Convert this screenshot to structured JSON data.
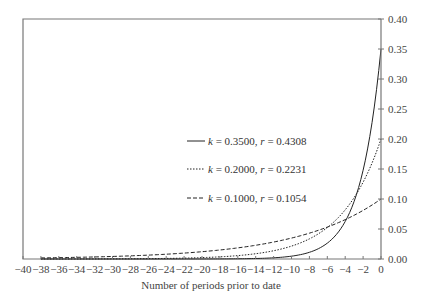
{
  "chart_data": {
    "type": "line",
    "title": "",
    "xlabel": "Number of periods prior to date",
    "ylabel": "",
    "xlim": [
      -40,
      0
    ],
    "ylim": [
      0,
      0.4
    ],
    "grid": false,
    "legend_position": "center-right inside plot",
    "x_ticks": [
      -40,
      -38,
      -36,
      -34,
      -32,
      -30,
      -28,
      -26,
      -24,
      -22,
      -20,
      -18,
      -16,
      -14,
      -12,
      -10,
      -8,
      -6,
      -4,
      -2,
      0
    ],
    "y_ticks": [
      "0.00",
      "0.05",
      "0.10",
      "0.15",
      "0.20",
      "0.25",
      "0.30",
      "0.35",
      "0.40"
    ],
    "x": [
      -38,
      -36,
      -34,
      -32,
      -30,
      -28,
      -26,
      -24,
      -22,
      -20,
      -18,
      -16,
      -14,
      -12,
      -10,
      -8,
      -6,
      -4,
      -2,
      0
    ],
    "series": [
      {
        "name": "k = 0.3500, r = 0.4308",
        "k": 0.35,
        "r": 0.4308,
        "style": "solid",
        "values": [
          0.0,
          0.0,
          0.0,
          0.0,
          0.0,
          0.0,
          0.0,
          0.0,
          0.0,
          0.0,
          0.0001,
          0.0004,
          0.0008,
          0.002,
          0.0047,
          0.0112,
          0.0264,
          0.0625,
          0.1479,
          0.35
        ]
      },
      {
        "name": "k = 0.2000, r = 0.2231",
        "k": 0.2,
        "r": 0.2231,
        "style": "dotted",
        "values": [
          0.0,
          0.0001,
          0.0001,
          0.0002,
          0.0002,
          0.0004,
          0.0006,
          0.0009,
          0.0015,
          0.0023,
          0.0036,
          0.0056,
          0.0088,
          0.0137,
          0.0215,
          0.0336,
          0.0524,
          0.0819,
          0.128,
          0.2
        ]
      },
      {
        "name": "k = 0.1000, r = 0.1054",
        "k": 0.1,
        "r": 0.1054,
        "style": "dashed",
        "values": [
          0.0018,
          0.0023,
          0.0028,
          0.0034,
          0.0042,
          0.0052,
          0.0065,
          0.008,
          0.0098,
          0.0122,
          0.015,
          0.0185,
          0.0229,
          0.0282,
          0.0349,
          0.043,
          0.0531,
          0.0656,
          0.081,
          0.1
        ]
      }
    ]
  },
  "legend": [
    {
      "k_label": "k",
      "k_value": " = 0.3500, ",
      "r_label": "r",
      "r_value": " = 0.4308"
    },
    {
      "k_label": "k",
      "k_value": " = 0.2000, ",
      "r_label": "r",
      "r_value": " = 0.2231"
    },
    {
      "k_label": "k",
      "k_value": " = 0.1000, ",
      "r_label": "r",
      "r_value": " = 0.1054"
    }
  ]
}
